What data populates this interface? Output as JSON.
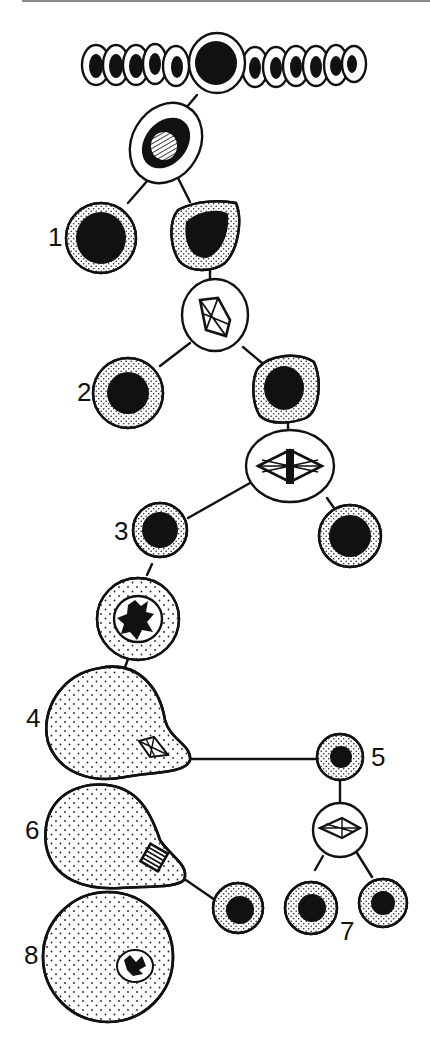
{
  "diagram": {
    "type": "cell-lineage",
    "colors": {
      "ink": "#111111",
      "background": "#ffffff",
      "stipple": "#222222",
      "rule": "#8a8a8a"
    },
    "labels": [
      {
        "id": "1",
        "text": "1"
      },
      {
        "id": "2",
        "text": "2"
      },
      {
        "id": "3",
        "text": "3"
      },
      {
        "id": "4",
        "text": "4"
      },
      {
        "id": "5",
        "text": "5"
      },
      {
        "id": "6",
        "text": "6"
      },
      {
        "id": "7",
        "text": "7"
      },
      {
        "id": "8",
        "text": "8"
      }
    ],
    "nodes": [
      {
        "name": "epithelium-row",
        "cells": 12
      },
      {
        "name": "dividing-cell-prophase",
        "nucleus": "hatched"
      },
      {
        "name": "cell-1",
        "label": "1"
      },
      {
        "name": "cell-1-sister"
      },
      {
        "name": "dividing-cell-spindle-1"
      },
      {
        "name": "cell-2",
        "label": "2"
      },
      {
        "name": "cell-2-sister"
      },
      {
        "name": "dividing-cell-metaphase"
      },
      {
        "name": "cell-3",
        "label": "3"
      },
      {
        "name": "cell-3-sister"
      },
      {
        "name": "cell-prophase-chromatin"
      },
      {
        "name": "oocyte-4",
        "label": "4",
        "spindle": true
      },
      {
        "name": "polar-body-5",
        "label": "5"
      },
      {
        "name": "polar-body-dividing"
      },
      {
        "name": "oocyte-6",
        "label": "6",
        "spindle": "anaphase"
      },
      {
        "name": "polar-body-second"
      },
      {
        "name": "polar-bodies-7",
        "label": "7",
        "count": 2
      },
      {
        "name": "ovum-8",
        "label": "8",
        "nucleus": "pronucleus"
      }
    ]
  }
}
